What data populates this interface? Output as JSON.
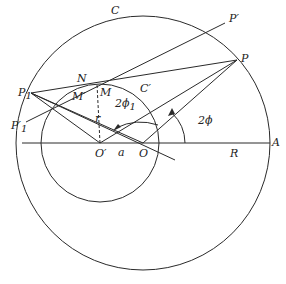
{
  "figure": {
    "labels": {
      "C": "C",
      "C_prime": "C′",
      "P": "P",
      "P_prime": "P′",
      "P1": "P",
      "P1_sub": "1",
      "P1_prime": "P′",
      "P1_prime_sub": "1",
      "N": "N",
      "M": "M",
      "M_prime": "M′",
      "r": "r",
      "two_phi1": "2ϕ",
      "two_phi1_sub": "1",
      "two_phi": "2ϕ",
      "O": "O",
      "O_prime": "O′",
      "a": "a",
      "R": "R",
      "A": "A"
    },
    "colors": {
      "stroke": "#2a2a2a",
      "background": "#ffffff"
    }
  }
}
